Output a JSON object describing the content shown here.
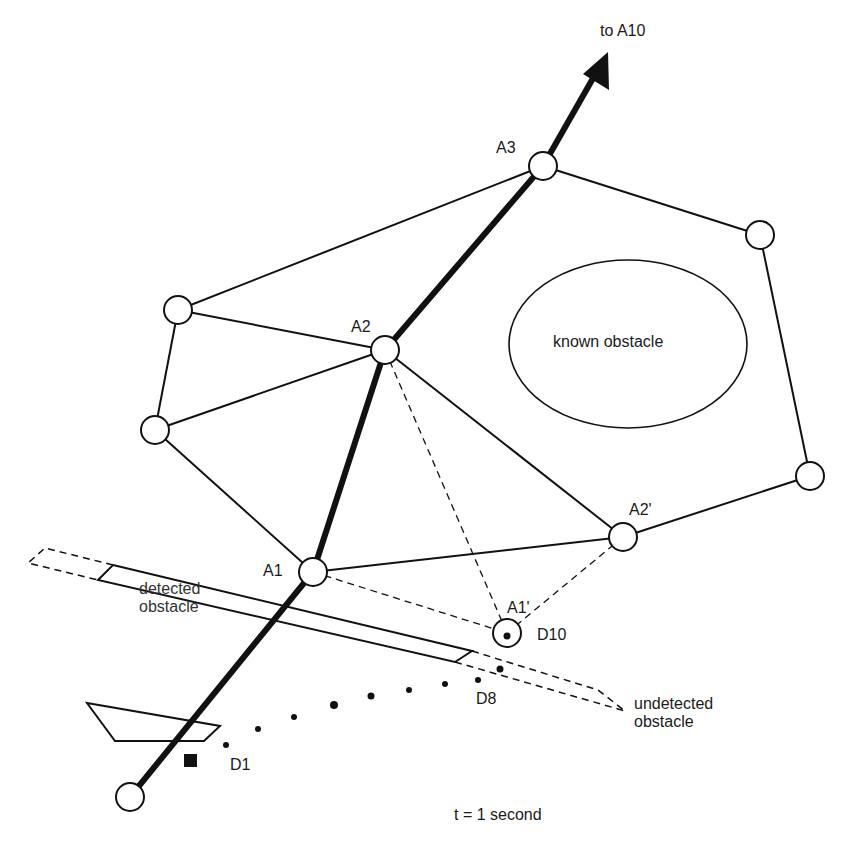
{
  "diagram": {
    "labels": {
      "to_a10": "to A10",
      "a3": "A3",
      "a2": "A2",
      "a2_prime": "A2'",
      "a1": "A1",
      "a1_prime": "A1'",
      "d10": "D10",
      "d8": "D8",
      "d1": "D1",
      "known_obstacle": "known obstacle",
      "detected_obstacle_line1": "detected",
      "detected_obstacle_line2": "obstacle",
      "undetected_obstacle_line1": "undetected",
      "undetected_obstacle_line2": "obstacle",
      "time": "t = 1 second"
    },
    "nodes": [
      {
        "id": "start",
        "x": 130,
        "y": 797
      },
      {
        "id": "A1",
        "x": 313,
        "y": 572
      },
      {
        "id": "A2",
        "x": 385,
        "y": 350
      },
      {
        "id": "A3",
        "x": 543,
        "y": 166
      },
      {
        "id": "top-left",
        "x": 178,
        "y": 310
      },
      {
        "id": "left",
        "x": 155,
        "y": 430
      },
      {
        "id": "right-top",
        "x": 760,
        "y": 235
      },
      {
        "id": "right-bottom",
        "x": 810,
        "y": 476
      },
      {
        "id": "A2'",
        "x": 623,
        "y": 537
      },
      {
        "id": "A1'",
        "x": 507,
        "y": 633
      }
    ],
    "colors": {
      "line": "#111111",
      "background": "#ffffff"
    }
  }
}
